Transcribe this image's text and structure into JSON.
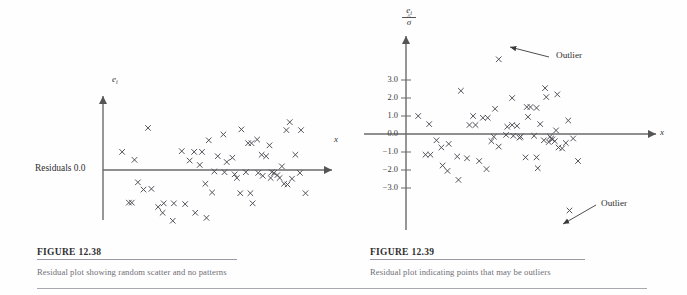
{
  "figure_group": {
    "background": "#ffffff",
    "ink": "#3a3a3a",
    "caption_color": "#6f6f76",
    "rule_color": "#9a9aa2"
  },
  "panels": [
    {
      "id": "figure-12-38",
      "figure_label": "FIGURE 12.38",
      "caption": "Residual plot showing random scatter and no patterns",
      "y_axis_label": "e",
      "y_axis_sub": "i",
      "x_axis_label": "x",
      "origin_label": "Residuals  0.0",
      "chart_data": {
        "type": "scatter",
        "title": "Residual plot showing random scatter and no patterns",
        "xlabel": "x",
        "ylabel": "e_i",
        "grid": false,
        "legend": null,
        "annotations": [
          {
            "text": "Residuals  0.0",
            "at_y": 0.0,
            "position": "left-of-origin"
          }
        ],
        "axis_style": "arrowed",
        "xlim": [
          0,
          100
        ],
        "ylim": [
          -4.2,
          4.2
        ],
        "marker": "x",
        "points": [
          [
            8.5,
            1.25
          ],
          [
            14.0,
            0.7
          ],
          [
            15.5,
            -0.85
          ],
          [
            18.0,
            -1.35
          ],
          [
            21.5,
            -1.3
          ],
          [
            11.5,
            -2.25
          ],
          [
            12.8,
            -2.25
          ],
          [
            20.0,
            2.9
          ],
          [
            24.5,
            -2.55
          ],
          [
            26.5,
            -2.95
          ],
          [
            31.0,
            -3.5
          ],
          [
            27.0,
            -2.3
          ],
          [
            31.5,
            -2.3
          ],
          [
            35.0,
            1.3
          ],
          [
            38.5,
            0.65
          ],
          [
            40.5,
            1.25
          ],
          [
            44.0,
            1.25
          ],
          [
            36.5,
            -2.35
          ],
          [
            41.0,
            -2.95
          ],
          [
            47.0,
            2.05
          ],
          [
            45.5,
            -0.95
          ],
          [
            48.5,
            -1.55
          ],
          [
            46.0,
            -3.3
          ],
          [
            53.5,
            2.45
          ],
          [
            51.0,
            0.95
          ],
          [
            55.0,
            0.55
          ],
          [
            57.5,
            0.85
          ],
          [
            54.0,
            -0.15
          ],
          [
            49.5,
            -0.1
          ],
          [
            58.5,
            -0.3
          ],
          [
            61.5,
            2.8
          ],
          [
            64.5,
            1.85
          ],
          [
            66.0,
            1.85
          ],
          [
            68.5,
            2.1
          ],
          [
            70.5,
            1.05
          ],
          [
            63.5,
            -0.15
          ],
          [
            61.0,
            -1.6
          ],
          [
            65.5,
            -1.6
          ],
          [
            66.5,
            -2.3
          ],
          [
            72.5,
            0.95
          ],
          [
            74.0,
            1.7
          ],
          [
            76.0,
            -0.2
          ],
          [
            71.0,
            -0.4
          ],
          [
            74.5,
            -0.55
          ],
          [
            77.5,
            -0.35
          ],
          [
            79.5,
            0.25
          ],
          [
            78.5,
            -0.55
          ],
          [
            80.5,
            -0.95
          ],
          [
            82.0,
            -1.0
          ],
          [
            84.0,
            -0.6
          ],
          [
            83.0,
            3.3
          ],
          [
            81.5,
            2.75
          ],
          [
            88.0,
            2.75
          ],
          [
            85.5,
            1.05
          ],
          [
            87.5,
            -0.2
          ],
          [
            90.0,
            -1.6
          ],
          [
            75.0,
            -0.15
          ],
          [
            69.0,
            -0.2
          ],
          [
            59.5,
            -0.55
          ],
          [
            43.0,
            0.35
          ]
        ]
      }
    },
    {
      "id": "figure-12-39",
      "figure_label": "FIGURE 12.39",
      "caption": "Residual plot indicating points that may be outliers",
      "y_axis_numerator": "e",
      "y_axis_numerator_sub": "i",
      "y_axis_denominator": "σ",
      "y_axis_denominator_hat": "^",
      "x_axis_label": "x",
      "outlier_annotations": [
        {
          "label": "Outlier",
          "target": "upper-outlier-point"
        },
        {
          "label": "Outlier",
          "target": "lower-outlier-point"
        }
      ],
      "chart_data": {
        "type": "scatter",
        "title": "Residual plot indicating points that may be outliers",
        "xlabel": "x",
        "ylabel": "e_i / sigma-hat",
        "grid": false,
        "legend": null,
        "axis_style": "arrowed",
        "y_ticks": [
          3.0,
          2.0,
          1.0,
          0.0,
          -1.0,
          -2.0,
          -3.0
        ],
        "y_tick_labels": [
          "3.0",
          "2.0",
          "1.0",
          "0.0",
          "-1.0",
          "-2.0",
          "-3.0"
        ],
        "xlim": [
          0,
          100
        ],
        "ylim": [
          -4.6,
          4.6
        ],
        "marker": "x",
        "annotations": [
          {
            "text": "Outlier",
            "points_to": [
              38.0,
              4.15
            ]
          },
          {
            "text": "Outlier",
            "points_to": [
              67.0,
              -4.25
            ]
          }
        ],
        "points": [
          [
            5.0,
            1.0
          ],
          [
            9.5,
            0.55
          ],
          [
            12.5,
            -0.35
          ],
          [
            14.5,
            -0.75
          ],
          [
            17.5,
            -0.55
          ],
          [
            8.0,
            -1.15
          ],
          [
            10.0,
            -1.15
          ],
          [
            15.0,
            -1.75
          ],
          [
            17.0,
            -2.05
          ],
          [
            21.5,
            -2.55
          ],
          [
            22.5,
            2.4
          ],
          [
            21.0,
            -1.25
          ],
          [
            25.0,
            -1.35
          ],
          [
            27.5,
            1.0
          ],
          [
            28.5,
            0.5
          ],
          [
            31.5,
            0.9
          ],
          [
            33.5,
            0.9
          ],
          [
            30.0,
            -1.5
          ],
          [
            33.0,
            -1.95
          ],
          [
            36.5,
            1.4
          ],
          [
            35.0,
            -0.4
          ],
          [
            38.0,
            -0.7
          ],
          [
            38.0,
            4.15
          ],
          [
            43.5,
            2.0
          ],
          [
            41.5,
            0.4
          ],
          [
            43.5,
            0.5
          ],
          [
            45.5,
            0.45
          ],
          [
            44.0,
            -0.1
          ],
          [
            41.0,
            -0.05
          ],
          [
            47.0,
            -0.15
          ],
          [
            49.5,
            1.5
          ],
          [
            51.0,
            1.5
          ],
          [
            50.0,
            0.95
          ],
          [
            53.5,
            1.45
          ],
          [
            55.0,
            0.55
          ],
          [
            52.5,
            -0.1
          ],
          [
            49.0,
            -1.3
          ],
          [
            53.5,
            -1.3
          ],
          [
            54.0,
            -1.9
          ],
          [
            57.0,
            2.55
          ],
          [
            57.5,
            2.05
          ],
          [
            59.5,
            -0.25
          ],
          [
            56.5,
            -0.35
          ],
          [
            58.5,
            -0.45
          ],
          [
            60.0,
            -0.3
          ],
          [
            61.5,
            0.2
          ],
          [
            61.0,
            -0.4
          ],
          [
            62.5,
            -0.75
          ],
          [
            64.0,
            -0.8
          ],
          [
            65.5,
            -0.5
          ],
          [
            62.0,
            2.2
          ],
          [
            66.5,
            0.75
          ],
          [
            68.5,
            -0.25
          ],
          [
            70.5,
            -1.5
          ],
          [
            67.0,
            -4.25
          ],
          [
            59.0,
            -0.15
          ],
          [
            46.5,
            -0.2
          ],
          [
            36.0,
            -0.15
          ],
          [
            26.0,
            0.5
          ]
        ]
      }
    }
  ]
}
